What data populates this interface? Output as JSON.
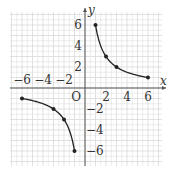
{
  "chart_data": {
    "type": "line",
    "title": "",
    "xlabel": "x",
    "ylabel": "y",
    "origin_label": "O",
    "xlim": [
      -7,
      7
    ],
    "ylim": [
      -7,
      7
    ],
    "grid": true,
    "grid_step": 0.5,
    "x_ticks": [
      -6,
      -4,
      -2,
      2,
      4,
      6
    ],
    "y_ticks": [
      6,
      4,
      2,
      -2,
      -4,
      -6
    ],
    "x_tick_labels": [
      "−6",
      "−4",
      "−2",
      "2",
      "4",
      "6"
    ],
    "y_tick_labels": [
      "6",
      "4",
      "2",
      "−2",
      "−4",
      "−6"
    ],
    "series": [
      {
        "name": "branch-positive",
        "function": "y = 6/x",
        "x_range": [
          1,
          6
        ],
        "points": [
          [
            1,
            6
          ],
          [
            2,
            3
          ],
          [
            3,
            2
          ],
          [
            6,
            1
          ]
        ]
      },
      {
        "name": "branch-negative",
        "function": "y = 6/x",
        "x_range": [
          -6,
          -1
        ],
        "points": [
          [
            -6,
            -1
          ],
          [
            -3,
            -2
          ],
          [
            -2,
            -3
          ],
          [
            -1,
            -6
          ]
        ]
      }
    ],
    "colors": {
      "curve": "#222222",
      "grid": "#d9d9d9",
      "axis": "#555555"
    }
  }
}
